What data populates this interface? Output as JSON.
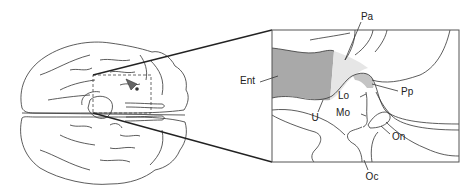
{
  "figure": {
    "type": "anatomical-diagram",
    "inset_labels": [
      {
        "id": "Pa",
        "text": "Pa",
        "x": 367,
        "y": 20
      },
      {
        "id": "Ent",
        "text": "Ent",
        "x": 240,
        "y": 84
      },
      {
        "id": "Pp",
        "text": "Pp",
        "x": 401,
        "y": 95
      },
      {
        "id": "Lo",
        "text": "Lo",
        "x": 349,
        "y": 99
      },
      {
        "id": "U",
        "text": "U",
        "x": 315,
        "y": 120
      },
      {
        "id": "Mo",
        "text": "Mo",
        "x": 348,
        "y": 116
      },
      {
        "id": "On",
        "text": "On",
        "x": 392,
        "y": 139
      },
      {
        "id": "Oc",
        "text": "Oc",
        "x": 365,
        "y": 178
      }
    ],
    "colors": {
      "line": "#333333",
      "ent_fill": "#a9a9a9",
      "pa_fill": "#e6e6e6",
      "pp_fill": "#c4c4c4",
      "background": "#ffffff"
    }
  }
}
